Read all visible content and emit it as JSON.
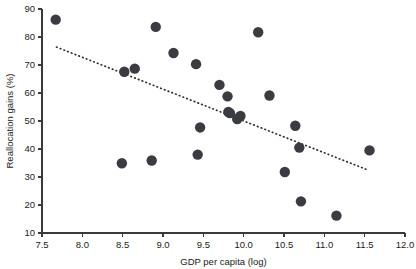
{
  "chart_data": {
    "type": "scatter",
    "title": "",
    "xlabel": "GDP per capita (log)",
    "ylabel": "Reallocation gains (%)",
    "xlim": [
      7.5,
      12.0
    ],
    "ylim": [
      10,
      90
    ],
    "xticks": [
      "7.5",
      "8.0",
      "8.5",
      "9.0",
      "9.5",
      "10.0",
      "10.5",
      "11.0",
      "11.5",
      "12.0"
    ],
    "xtick_values": [
      7.5,
      8.0,
      8.5,
      9.0,
      9.5,
      10.0,
      10.5,
      11.0,
      11.5,
      12.0
    ],
    "yticks": [
      "10",
      "20",
      "30",
      "40",
      "50",
      "60",
      "70",
      "80",
      "90"
    ],
    "ytick_values": [
      10,
      20,
      30,
      40,
      50,
      60,
      70,
      80,
      90
    ],
    "grid": false,
    "legend": false,
    "marker_color": "#3b3b42",
    "marker_size": 5.2,
    "points": [
      {
        "x": 7.67,
        "y": 86.2
      },
      {
        "x": 8.49,
        "y": 34.9
      },
      {
        "x": 8.52,
        "y": 67.6
      },
      {
        "x": 8.65,
        "y": 68.7
      },
      {
        "x": 8.86,
        "y": 35.9
      },
      {
        "x": 8.91,
        "y": 83.6
      },
      {
        "x": 9.13,
        "y": 74.3
      },
      {
        "x": 9.41,
        "y": 70.3
      },
      {
        "x": 9.43,
        "y": 38.0
      },
      {
        "x": 9.46,
        "y": 47.7
      },
      {
        "x": 9.7,
        "y": 62.9
      },
      {
        "x": 9.8,
        "y": 58.8
      },
      {
        "x": 9.81,
        "y": 53.2
      },
      {
        "x": 9.83,
        "y": 52.8
      },
      {
        "x": 9.92,
        "y": 50.7
      },
      {
        "x": 9.96,
        "y": 51.8
      },
      {
        "x": 10.18,
        "y": 81.7
      },
      {
        "x": 10.32,
        "y": 59.1
      },
      {
        "x": 10.51,
        "y": 31.8
      },
      {
        "x": 10.64,
        "y": 48.3
      },
      {
        "x": 10.69,
        "y": 40.5
      },
      {
        "x": 10.71,
        "y": 21.3
      },
      {
        "x": 11.15,
        "y": 16.2
      },
      {
        "x": 11.56,
        "y": 39.5
      }
    ],
    "trend_line": {
      "style": "dotted",
      "x_start": 7.68,
      "y_start": 76.4,
      "x_end": 11.54,
      "y_end": 32.5
    }
  }
}
